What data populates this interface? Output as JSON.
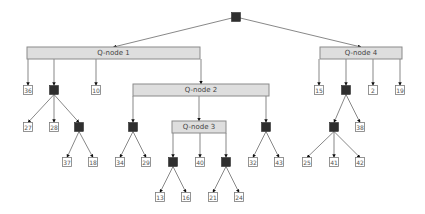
{
  "diagram": {
    "type": "PQ-tree",
    "root": "P0",
    "nodes": {
      "P0": {
        "kind": "P"
      },
      "Q1": {
        "kind": "Q",
        "label": "Q-node 1"
      },
      "Q2": {
        "kind": "Q",
        "label": "Q-node 2"
      },
      "Q3": {
        "kind": "Q",
        "label": "Q-node 3"
      },
      "Q4": {
        "kind": "Q",
        "label": "Q-node 4"
      },
      "P1": {
        "kind": "P"
      },
      "P2": {
        "kind": "P"
      },
      "P3": {
        "kind": "P"
      },
      "P4": {
        "kind": "P"
      },
      "P5": {
        "kind": "P"
      },
      "P6": {
        "kind": "P"
      },
      "P7": {
        "kind": "P"
      },
      "P8": {
        "kind": "P"
      },
      "L36": {
        "kind": "leaf",
        "label": "36"
      },
      "L10": {
        "kind": "leaf",
        "label": "10"
      },
      "L27": {
        "kind": "leaf",
        "label": "27"
      },
      "L28": {
        "kind": "leaf",
        "label": "28"
      },
      "L37": {
        "kind": "leaf",
        "label": "37"
      },
      "L18": {
        "kind": "leaf",
        "label": "18"
      },
      "L34": {
        "kind": "leaf",
        "label": "34"
      },
      "L29": {
        "kind": "leaf",
        "label": "29"
      },
      "L40": {
        "kind": "leaf",
        "label": "40"
      },
      "L13": {
        "kind": "leaf",
        "label": "13"
      },
      "L16": {
        "kind": "leaf",
        "label": "16"
      },
      "L21": {
        "kind": "leaf",
        "label": "21"
      },
      "L24": {
        "kind": "leaf",
        "label": "24"
      },
      "L32": {
        "kind": "leaf",
        "label": "32"
      },
      "L43": {
        "kind": "leaf",
        "label": "43"
      },
      "L15": {
        "kind": "leaf",
        "label": "15"
      },
      "L2": {
        "kind": "leaf",
        "label": "2"
      },
      "L19": {
        "kind": "leaf",
        "label": "19"
      },
      "L38": {
        "kind": "leaf",
        "label": "38"
      },
      "L25": {
        "kind": "leaf",
        "label": "25"
      },
      "L41": {
        "kind": "leaf",
        "label": "41"
      },
      "L42": {
        "kind": "leaf",
        "label": "42"
      }
    },
    "edges": [
      [
        "P0",
        "Q1"
      ],
      [
        "P0",
        "Q4"
      ],
      [
        "Q1",
        "L36"
      ],
      [
        "Q1",
        "P1"
      ],
      [
        "Q1",
        "L10"
      ],
      [
        "Q1",
        "Q2"
      ],
      [
        "P1",
        "L27"
      ],
      [
        "P1",
        "L28"
      ],
      [
        "P1",
        "P2"
      ],
      [
        "P2",
        "L37"
      ],
      [
        "P2",
        "L18"
      ],
      [
        "Q2",
        "P3"
      ],
      [
        "Q2",
        "Q3"
      ],
      [
        "Q2",
        "P4"
      ],
      [
        "P3",
        "L34"
      ],
      [
        "P3",
        "L29"
      ],
      [
        "Q3",
        "P5"
      ],
      [
        "Q3",
        "L40"
      ],
      [
        "Q3",
        "P6"
      ],
      [
        "P5",
        "L13"
      ],
      [
        "P5",
        "L16"
      ],
      [
        "P6",
        "L21"
      ],
      [
        "P6",
        "L24"
      ],
      [
        "P4",
        "L32"
      ],
      [
        "P4",
        "L43"
      ],
      [
        "Q4",
        "L15"
      ],
      [
        "Q4",
        "P7"
      ],
      [
        "Q4",
        "L2"
      ],
      [
        "Q4",
        "L19"
      ],
      [
        "P7",
        "P8"
      ],
      [
        "P7",
        "L38"
      ],
      [
        "P8",
        "L25"
      ],
      [
        "P8",
        "L41"
      ],
      [
        "P8",
        "L42"
      ]
    ]
  }
}
